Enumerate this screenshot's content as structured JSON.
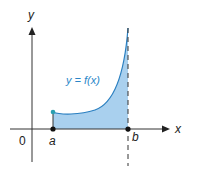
{
  "diagram": {
    "type": "area-under-curve",
    "axes": {
      "x_label": "x",
      "y_label": "y",
      "origin_label": "0"
    },
    "points": {
      "a_label": "a",
      "b_label": "b"
    },
    "curve_label": "y = f(x)",
    "colors": {
      "fill": "#a9d0ee",
      "curve": "#2a7fc0",
      "label": "#2a86c8",
      "axis": "#333333",
      "dot_a": "#2a9fb0",
      "dot": "#111111"
    }
  }
}
